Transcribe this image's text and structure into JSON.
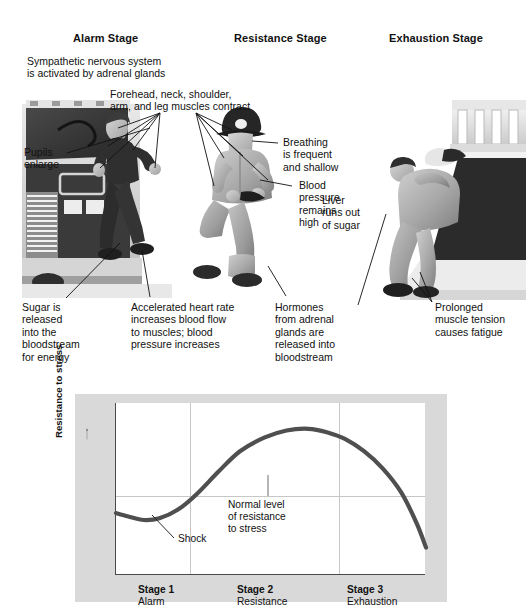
{
  "diagram": {
    "stages": [
      {
        "id": "alarm",
        "heading": "Alarm Stage"
      },
      {
        "id": "resistance",
        "heading": "Resistance Stage"
      },
      {
        "id": "exhaustion",
        "heading": "Exhaustion Stage"
      }
    ],
    "callouts": [
      {
        "id": "sympathetic",
        "text": "Sympathetic nervous system\nis activated by adrenal glands"
      },
      {
        "id": "muscles",
        "text": "Forehead, neck, shoulder,\narm, and leg muscles contract"
      },
      {
        "id": "pupils",
        "text": "Pupils\nenlarge"
      },
      {
        "id": "breathing",
        "text": "Breathing\nis frequent\nand shallow"
      },
      {
        "id": "blood-pressure",
        "text": "Blood\npressure\nremains\nhigh"
      },
      {
        "id": "liver",
        "text": "Liver\nruns out\nof sugar"
      },
      {
        "id": "sugar",
        "text": "Sugar is\nreleased\ninto the\nbloodstream\nfor energy"
      },
      {
        "id": "heart-rate",
        "text": "Accelerated heart rate\nincreases blood flow\nto muscles; blood\npressure increases"
      },
      {
        "id": "hormones",
        "text": "Hormones\nfrom adrenal\nglands are\nreleased into\nbloodstream"
      },
      {
        "id": "fatigue",
        "text": "Prolonged\nmuscle tension\ncauses fatigue"
      }
    ]
  },
  "chart_data": {
    "type": "line",
    "title": "",
    "xlabel": "",
    "ylabel": "Resistance to stress",
    "xlim": [
      0,
      100
    ],
    "ylim": [
      0,
      100
    ],
    "grid": true,
    "legend": false,
    "categories": [
      "Stage 1",
      "Stage 2",
      "Stage 3"
    ],
    "category_sublabels": [
      "Alarm",
      "Resistance",
      "Exhaustion"
    ],
    "x_boundaries": [
      0,
      24,
      72,
      100
    ],
    "normal_level": 46,
    "series": [
      {
        "name": "Resistance to stress",
        "color": "#4f4f4f",
        "x": [
          0,
          4,
          9,
          14,
          20,
          26,
          33,
          40,
          48,
          55,
          62,
          68,
          74,
          80,
          86,
          92,
          97,
          100
        ],
        "y": [
          36,
          34,
          32,
          33,
          38,
          47,
          60,
          72,
          80,
          84,
          85,
          83,
          79,
          72,
          62,
          48,
          30,
          16
        ]
      }
    ],
    "annotations": [
      {
        "id": "shock",
        "text": "Shock",
        "x": 13,
        "y": 20,
        "points_to_x": 9,
        "points_to_y": 31
      },
      {
        "id": "normal-level",
        "text": "Normal level\nof resistance\nto stress",
        "x": 45,
        "y": 30,
        "points_to_x": 48,
        "points_to_y": 46
      }
    ]
  }
}
